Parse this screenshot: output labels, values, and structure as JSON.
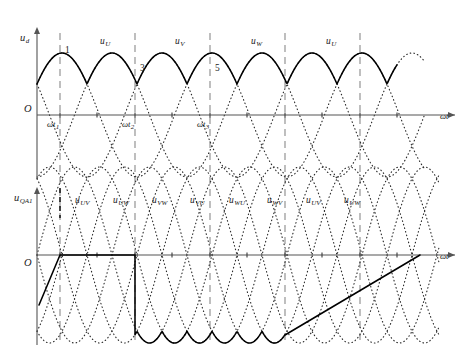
{
  "figure": {
    "title_axis_x_top": "ωt",
    "title_axis_x_bottom": "ωt",
    "origin_label_top": "O",
    "origin_label_bottom": "O"
  },
  "top_chart": {
    "y_axis_label_main": "u",
    "y_axis_label_sub": "d",
    "x_axis_label": "ωt",
    "curve_labels": [
      {
        "main": "u",
        "sub": "U",
        "x": 100,
        "y": 44
      },
      {
        "main": "u",
        "sub": "V",
        "x": 175,
        "y": 44
      },
      {
        "main": "u",
        "sub": "W",
        "x": 251,
        "y": 44
      },
      {
        "main": "u",
        "sub": "U",
        "x": 326,
        "y": 44
      }
    ],
    "commutation_numbers": [
      {
        "text": "1",
        "x": 65,
        "y": 53
      },
      {
        "text": "3",
        "x": 140,
        "y": 71
      },
      {
        "text": "5",
        "x": 215,
        "y": 71
      }
    ],
    "tick_labels": [
      {
        "main": "ωt",
        "sub": "1",
        "x": 47,
        "y": 127
      },
      {
        "main": "ωt",
        "sub": "2",
        "x": 122,
        "y": 127
      },
      {
        "main": "ωt",
        "sub": "3",
        "x": 197,
        "y": 127
      }
    ]
  },
  "bottom_chart": {
    "y_axis_label_main": "u",
    "y_axis_label_sub": "QA1",
    "x_axis_label": "ωt",
    "curve_labels": [
      {
        "main": "u",
        "sub": "UV",
        "x": 75,
        "y": 203
      },
      {
        "main": "u",
        "sub": "UW",
        "x": 113,
        "y": 203
      },
      {
        "main": "u",
        "sub": "VW",
        "x": 152,
        "y": 203
      },
      {
        "main": "u",
        "sub": "VU",
        "x": 190,
        "y": 203
      },
      {
        "main": "u",
        "sub": "WU",
        "x": 229,
        "y": 203
      },
      {
        "main": "u",
        "sub": "WV",
        "x": 267,
        "y": 203
      },
      {
        "main": "u",
        "sub": "UV",
        "x": 306,
        "y": 203
      },
      {
        "main": "u",
        "sub": "UW",
        "x": 344,
        "y": 203
      }
    ]
  },
  "chart_data": {
    "type": "line",
    "xlabel": "ωt",
    "ylabel": "u_d / u_QA1",
    "grid": false,
    "legend": "inline-labels",
    "geometry": {
      "x_origin": 37,
      "x_end": 455,
      "x_axis_arrow_top_y": 115,
      "x_axis_arrow_bottom_y": 255,
      "top_axis_y": 115,
      "bottom_axis_y": 255,
      "top_y_axis_top": 33,
      "bottom_y_axis_top": 193,
      "top_chart_bottom": 178,
      "bottom_chart_bottom": 345,
      "degrees_per_px": 2.4,
      "phase_period_px": 150,
      "amplitude_top_px": 62,
      "amplitude_bottom_px": 88
    },
    "dashed_verticals_x": [
      60,
      135,
      210,
      285,
      360
    ],
    "dashed_vertical_top_y": 33,
    "dashed_vertical_bottom_y": 345,
    "dark_dashed_vertical_x": 60,
    "dark_dashed_segment": [
      188,
      218
    ],
    "phase_voltages": {
      "description": "Three dotted phase sine waves u_U, u_V, u_W, 120 degrees apart",
      "series": [
        {
          "name": "u_U",
          "phase_deg": 30,
          "amplitude": 62
        },
        {
          "name": "u_V",
          "phase_deg": 150,
          "amplitude": 62
        },
        {
          "name": "u_W",
          "phase_deg": 270,
          "amplitude": 62
        }
      ]
    },
    "rectified_output": {
      "name": "u_d",
      "description": "Upper envelope of three phase voltages - six-pulse rectified waveform",
      "peak_value": 62,
      "valley_value": 31,
      "segments": [
        "u_U",
        "u_V",
        "u_W",
        "u_U"
      ]
    },
    "line_voltages": {
      "description": "Six dotted line-to-line voltage curves in lower chart",
      "series": [
        {
          "name": "u_UV",
          "phase_deg": 60,
          "amplitude": 88
        },
        {
          "name": "u_UW",
          "phase_deg": 120,
          "amplitude": 88
        },
        {
          "name": "u_VW",
          "phase_deg": 180,
          "amplitude": 88
        },
        {
          "name": "u_VU",
          "phase_deg": 240,
          "amplitude": 88
        },
        {
          "name": "u_WU",
          "phase_deg": 300,
          "amplitude": 88
        },
        {
          "name": "u_WV",
          "phase_deg": 0,
          "amplitude": 88
        }
      ]
    },
    "thyristor_voltage": {
      "name": "u_QA1",
      "description": "Voltage across thyristor QA1: rising ramp, zero while conducting from wt1 to wt2, then negative line-voltage arcs, returning to zero",
      "zero_interval_x": [
        60,
        135
      ],
      "negative_arc_interval_x": [
        135,
        285
      ],
      "zero_after_x": [
        285,
        420
      ],
      "min_value": -88
    },
    "tick_positions_top_x": [
      60,
      97,
      135,
      172,
      210,
      247,
      285,
      322,
      360,
      397
    ],
    "tick_positions_bottom_x": [
      60,
      97,
      135,
      172,
      210,
      247,
      285,
      322,
      360,
      397
    ]
  }
}
